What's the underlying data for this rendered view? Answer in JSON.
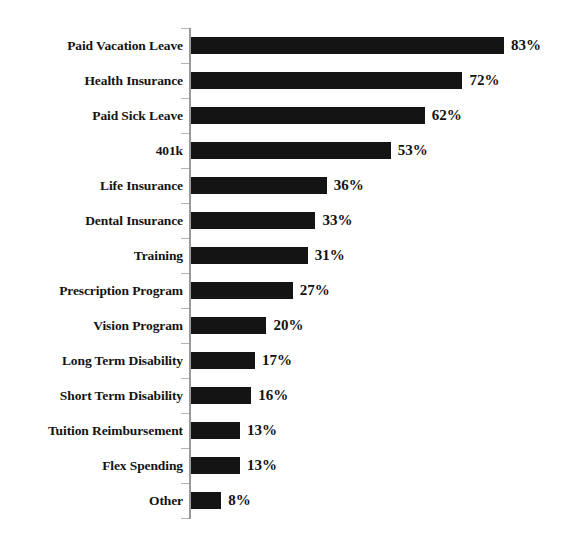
{
  "chart_data": {
    "type": "bar",
    "orientation": "horizontal",
    "title": "",
    "xlabel": "",
    "ylabel": "",
    "xlim": [
      0,
      100
    ],
    "grid": false,
    "legend": null,
    "value_suffix": "%",
    "categories": [
      "Paid Vacation Leave",
      "Health Insurance",
      "Paid Sick Leave",
      "401k",
      "Life Insurance",
      "Dental Insurance",
      "Training",
      "Prescription Program",
      "Vision Program",
      "Long Term Disability",
      "Short Term Disability",
      "Tuition Reimbursement",
      "Flex Spending",
      "Other"
    ],
    "values": [
      83,
      72,
      62,
      53,
      36,
      33,
      31,
      27,
      20,
      17,
      16,
      13,
      13,
      8
    ],
    "value_labels": [
      "83%",
      "72%",
      "62%",
      "53%",
      "36%",
      "33%",
      "31%",
      "27%",
      "20%",
      "17%",
      "16%",
      "13%",
      "13%",
      "8%"
    ],
    "bar_color": "#141414",
    "axis_color": "#9a9a9a",
    "text_color": "#131313"
  },
  "axis": {
    "tick_count": 15
  },
  "title_remnant": {
    "text": ""
  }
}
